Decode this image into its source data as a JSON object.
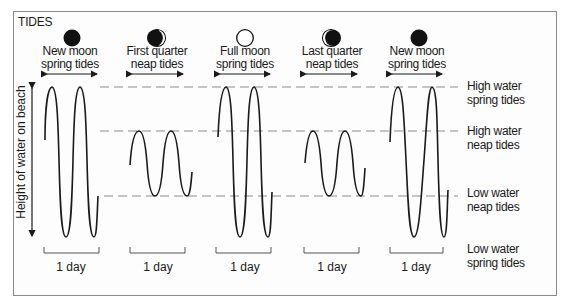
{
  "title": "TIDES",
  "y_axis_label": "Height of water on beach",
  "phases": [
    {
      "moon": "new-moon",
      "line1": "New moon",
      "line2": "spring tides",
      "tide": "spring"
    },
    {
      "moon": "first-quarter-moon",
      "line1": "First quarter",
      "line2": "neap tides",
      "tide": "neap"
    },
    {
      "moon": "full-moon",
      "line1": "Full moon",
      "line2": "spring tides",
      "tide": "spring"
    },
    {
      "moon": "last-quarter-moon",
      "line1": "Last quarter",
      "line2": "neap tides",
      "tide": "neap"
    },
    {
      "moon": "new-moon",
      "line1": "New moon",
      "line2": "spring tides",
      "tide": "spring"
    }
  ],
  "levels": [
    {
      "line1": "High water",
      "line2": "spring tides"
    },
    {
      "line1": "High water",
      "line2": "neap tides"
    },
    {
      "line1": "Low water",
      "line2": "neap tides"
    },
    {
      "line1": "Low water",
      "line2": "spring tides"
    }
  ],
  "day_labels": [
    "1 day",
    "1 day",
    "1 day",
    "1 day",
    "1 day"
  ],
  "colors": {
    "ink": "#1a1a1a",
    "dash": "#8c8c8c",
    "frame": "#8a8a8a"
  }
}
